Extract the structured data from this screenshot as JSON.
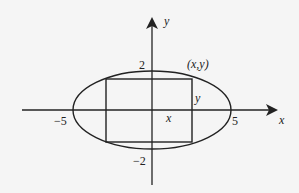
{
  "diagram": {
    "type": "ellipse-with-inscribed-rectangle",
    "axes": {
      "x_label": "x",
      "y_label": "y"
    },
    "ticks": {
      "x_neg": "−5",
      "x_pos": "5",
      "y_pos": "2",
      "y_neg": "−2"
    },
    "point_label": "(x,y)",
    "rect_width_label": "x",
    "rect_height_label": "y",
    "colors": {
      "stroke": "#222222",
      "background": "#f5f5f5"
    }
  }
}
